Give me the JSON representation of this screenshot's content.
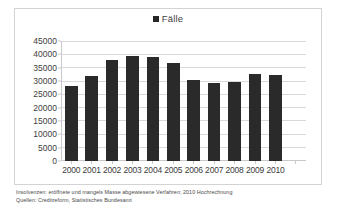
{
  "legend": {
    "marker_icon": "square-marker-icon",
    "label": "Fälle",
    "color": "#262626"
  },
  "footnote": {
    "line1": "Insolvenzen: eröffnete und mangels Masse abgewiesene Verfahren; 2010 Hochrechnung",
    "line2": "Quellen: Creditreform, Statistisches Bundesamt"
  },
  "chart_data": {
    "type": "bar",
    "title": "",
    "subtitle": "",
    "xlabel": "",
    "ylabel": "",
    "ylim": [
      0,
      45000
    ],
    "ytick_step": 5000,
    "yticks": [
      "45000",
      "40000",
      "35000",
      "30000",
      "25000",
      "20000",
      "15000",
      "10000",
      "5000",
      "0"
    ],
    "grid": true,
    "legend_position": "top-center",
    "series_name": "Fälle",
    "bar_color": "#2a2a2a",
    "categories": [
      "2000",
      "2001",
      "2002",
      "2003",
      "2004",
      "2005",
      "2006",
      "2007",
      "2008",
      "2009",
      "2010",
      ""
    ],
    "values": [
      28000,
      32000,
      37700,
      39300,
      39000,
      36800,
      30400,
      29200,
      29500,
      32700,
      32300,
      null
    ]
  }
}
